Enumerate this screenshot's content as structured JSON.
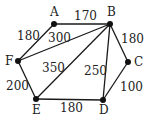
{
  "graph": {
    "nodes": [
      {
        "id": "A",
        "x": 54,
        "y": 24,
        "lx": 50,
        "ly": 16
      },
      {
        "id": "B",
        "x": 110,
        "y": 24,
        "lx": 107,
        "ly": 16
      },
      {
        "id": "C",
        "x": 128,
        "y": 62,
        "lx": 134,
        "ly": 66
      },
      {
        "id": "D",
        "x": 103,
        "y": 100,
        "lx": 99,
        "ly": 114
      },
      {
        "id": "E",
        "x": 36,
        "y": 99,
        "lx": 32,
        "ly": 114
      },
      {
        "id": "F",
        "x": 18,
        "y": 61,
        "lx": 5,
        "ly": 65
      }
    ],
    "edges": [
      {
        "from": "A",
        "to": "B",
        "weight": "170",
        "lx": 74,
        "ly": 20
      },
      {
        "from": "A",
        "to": "F",
        "weight": "180",
        "lx": 17,
        "ly": 40
      },
      {
        "from": "F",
        "to": "B",
        "weight": "300",
        "lx": 48,
        "ly": 42
      },
      {
        "from": "B",
        "to": "C",
        "weight": "180",
        "lx": 121,
        "ly": 43
      },
      {
        "from": "B",
        "to": "E",
        "weight": "350",
        "lx": 42,
        "ly": 72
      },
      {
        "from": "B",
        "to": "D",
        "weight": "250",
        "lx": 84,
        "ly": 75
      },
      {
        "from": "F",
        "to": "E",
        "weight": "200",
        "lx": 6,
        "ly": 90
      },
      {
        "from": "C",
        "to": "D",
        "weight": "100",
        "lx": 120,
        "ly": 91
      },
      {
        "from": "E",
        "to": "D",
        "weight": "180",
        "lx": 60,
        "ly": 112
      }
    ]
  }
}
